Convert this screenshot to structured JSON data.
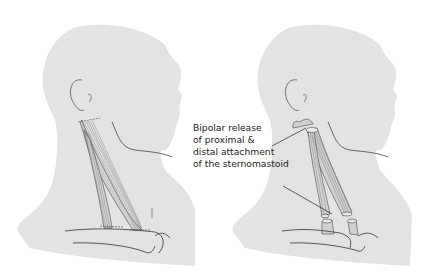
{
  "figure": {
    "panels": [
      {
        "id": "before",
        "description": "Sternomastoid muscle intact, proximal and distal attachments"
      },
      {
        "id": "after",
        "description": "Sternomastoid released at both ends"
      }
    ],
    "annotation": {
      "lines": [
        "Bipolar release",
        "of proximal &",
        "distal attachment",
        "of the sternomastoid"
      ]
    },
    "colors": {
      "silhouette": "#e3e3e3",
      "outline": "#333333",
      "muscle_fiber": "#555555",
      "background": "#ffffff"
    }
  }
}
